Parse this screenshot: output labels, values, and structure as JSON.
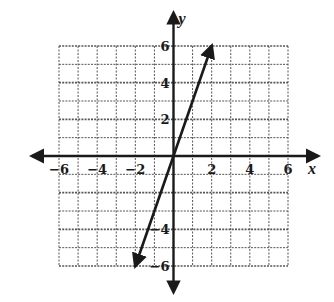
{
  "chart_data": {
    "type": "line",
    "title": "",
    "xlabel": "x",
    "ylabel": "y",
    "xlim": [
      -6,
      6
    ],
    "ylim": [
      -6,
      6
    ],
    "grid": true,
    "grid_step": 1,
    "x_tick_labels": [
      "-6",
      "-4",
      "-2",
      "2",
      "4",
      "6"
    ],
    "x_tick_values": [
      -6,
      -4,
      -2,
      2,
      4,
      6
    ],
    "y_tick_labels": [
      "6",
      "4",
      "2",
      "-4",
      "-6"
    ],
    "y_tick_values": [
      6,
      4,
      2,
      -4,
      -6
    ],
    "series": [
      {
        "name": "y = 3x",
        "x": [
          -2,
          2
        ],
        "y": [
          -6,
          6
        ],
        "arrows": "both"
      }
    ],
    "legend": null
  },
  "colors": {
    "ink": "#1a1a1a",
    "grid": "#555555",
    "background": "#ffffff"
  }
}
